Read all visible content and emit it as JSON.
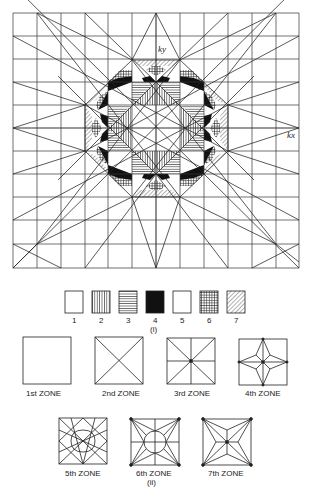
{
  "figure": {
    "main_diagram": {
      "name": "brillouin-zones-square-lattice",
      "axis_labels": {
        "ky": "ky",
        "kx": "kx"
      },
      "grid": {
        "x0": 13,
        "y0": 13,
        "x1": 299,
        "y1": 268,
        "cols": 12,
        "rows": 11
      },
      "center": [
        156,
        128
      ]
    },
    "legend": {
      "caption": "(i)",
      "items": [
        {
          "label": "1",
          "pattern": "blank"
        },
        {
          "label": "2",
          "pattern": "vertical-lines"
        },
        {
          "label": "3",
          "pattern": "horizontal-lines"
        },
        {
          "label": "4",
          "pattern": "solid-black"
        },
        {
          "label": "5",
          "pattern": "blank"
        },
        {
          "label": "6",
          "pattern": "crosshatch"
        },
        {
          "label": "7",
          "pattern": "diagonal-lines"
        }
      ]
    },
    "zones": {
      "caption": "(ii)",
      "items": [
        {
          "label": "1st ZONE"
        },
        {
          "label": "2nd ZONE"
        },
        {
          "label": "3rd ZONE"
        },
        {
          "label": "4th ZONE"
        },
        {
          "label": "5th ZONE"
        },
        {
          "label": "6th ZONE"
        },
        {
          "label": "7th ZONE"
        }
      ]
    },
    "colors": {
      "ink": "#222222",
      "paper": "#ffffff"
    }
  }
}
